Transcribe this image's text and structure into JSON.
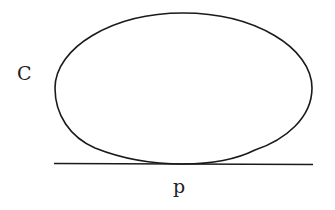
{
  "diagram": {
    "curve_label": "C",
    "point_label": "p",
    "stroke_color": "#1a1a1a"
  }
}
